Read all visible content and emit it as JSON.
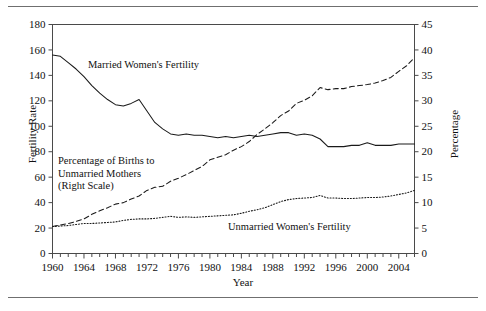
{
  "figure": {
    "top_rule": "",
    "bottom_rule": ""
  },
  "chart_data": {
    "type": "line",
    "title": "",
    "xlabel": "Year",
    "ylabel": "Fertility Rate",
    "ylabel_right": "Percentage",
    "grid": false,
    "legend_position": "inline-annotations",
    "xlim": [
      1960,
      2006
    ],
    "ylim": [
      0,
      180
    ],
    "ylim_right": [
      0,
      45
    ],
    "xticks": [
      1960,
      1964,
      1968,
      1972,
      1976,
      1980,
      1984,
      1988,
      1992,
      1996,
      2000,
      2004
    ],
    "xtick_labels": [
      "1960",
      "1964",
      "1968",
      "1972",
      "1976",
      "1980",
      "1984",
      "1988",
      "1992",
      "1996",
      "2000",
      "2004"
    ],
    "xtick_minor_step": 1,
    "yticks_left": [
      0,
      20,
      40,
      60,
      80,
      100,
      120,
      140,
      160,
      180
    ],
    "ytick_labels_left": [
      "0",
      "20",
      "40",
      "60",
      "80",
      "100",
      "120",
      "140",
      "160",
      "180"
    ],
    "yticks_right": [
      0,
      5,
      10,
      15,
      20,
      25,
      30,
      35,
      40,
      45
    ],
    "ytick_labels_right": [
      "0",
      "5",
      "10",
      "15",
      "20",
      "25",
      "30",
      "35",
      "40",
      "45"
    ],
    "x": [
      1960,
      1961,
      1962,
      1963,
      1964,
      1965,
      1966,
      1967,
      1968,
      1969,
      1970,
      1971,
      1972,
      1973,
      1974,
      1975,
      1976,
      1977,
      1978,
      1979,
      1980,
      1981,
      1982,
      1983,
      1984,
      1985,
      1986,
      1987,
      1988,
      1989,
      1990,
      1991,
      1992,
      1993,
      1994,
      1995,
      1996,
      1997,
      1998,
      1999,
      2000,
      2001,
      2002,
      2003,
      2004,
      2005,
      2006
    ],
    "series": [
      {
        "name": "Married Women's Fertility",
        "axis": "left",
        "style": "solid",
        "values": [
          156,
          155,
          150,
          145,
          139,
          132,
          126,
          121,
          117,
          116,
          118,
          121,
          112,
          103,
          98,
          94,
          93,
          94,
          93,
          93,
          92,
          91,
          92,
          91,
          92,
          93,
          92,
          93,
          94,
          95,
          95,
          93,
          94,
          93,
          90,
          84,
          84,
          84,
          85,
          85,
          87,
          85,
          85,
          85,
          86,
          86,
          86
        ]
      },
      {
        "name": "Percentage of Births to Unmarried Mothers (Right Scale)",
        "axis": "right",
        "style": "dashed",
        "values": [
          5.3,
          5.6,
          5.9,
          6.3,
          6.8,
          7.7,
          8.4,
          9.0,
          9.7,
          10.0,
          10.7,
          11.3,
          12.4,
          13.0,
          13.2,
          14.2,
          14.8,
          15.5,
          16.3,
          17.1,
          18.4,
          18.9,
          19.4,
          20.3,
          21.0,
          22.0,
          23.4,
          24.5,
          25.7,
          27.1,
          28.0,
          29.5,
          30.1,
          31.0,
          32.6,
          32.2,
          32.4,
          32.4,
          32.8,
          33.0,
          33.2,
          33.5,
          34.0,
          34.6,
          35.8,
          36.9,
          38.5
        ]
      },
      {
        "name": "Unmarried Women's Fertility",
        "axis": "right",
        "style": "dotted",
        "values": [
          5.3,
          5.4,
          5.5,
          5.7,
          5.9,
          5.9,
          6.0,
          6.1,
          6.2,
          6.5,
          6.7,
          6.8,
          6.8,
          6.9,
          7.1,
          7.3,
          7.1,
          7.2,
          7.1,
          7.2,
          7.3,
          7.4,
          7.5,
          7.6,
          7.9,
          8.3,
          8.6,
          9.0,
          9.6,
          10.2,
          10.6,
          10.8,
          10.9,
          11.0,
          11.4,
          10.9,
          10.9,
          10.8,
          10.8,
          10.9,
          11.0,
          11.0,
          11.1,
          11.3,
          11.6,
          11.9,
          12.4
        ]
      }
    ],
    "annotations": [
      {
        "id": "married",
        "text": "Married Women's Fertility"
      },
      {
        "id": "pct_line1",
        "text": "Percentage of Births to"
      },
      {
        "id": "pct_line2",
        "text": "Unmarried Mothers"
      },
      {
        "id": "pct_line3",
        "text": "(Right Scale)"
      },
      {
        "id": "unmarried",
        "text": "Unmarried Women's Fertility"
      }
    ],
    "colors": {
      "line": "#1a1a1a",
      "axis": "#4a4a4a",
      "rule": "#6f6f6f",
      "background": "#ffffff"
    }
  }
}
